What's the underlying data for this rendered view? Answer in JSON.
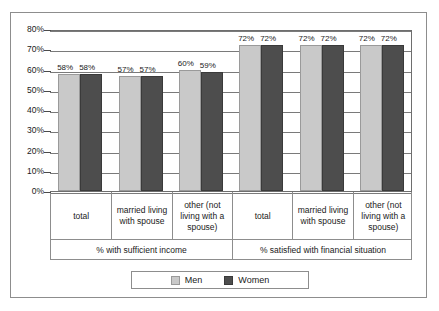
{
  "chart_data": {
    "type": "bar",
    "title": "",
    "xlabel": "",
    "ylabel": "",
    "ylim": [
      0,
      80
    ],
    "ytick_labels": [
      "80%",
      "70%",
      "60%",
      "50%",
      "40%",
      "30%",
      "20%",
      "10%",
      "0%"
    ],
    "ytick_values": [
      80,
      70,
      60,
      50,
      40,
      30,
      20,
      10,
      0
    ],
    "grid": true,
    "legend_position": "bottom",
    "value_suffix": "%",
    "categories": [
      "total",
      "married living with spouse",
      "other (not living with a spouse)",
      "total",
      "married living with spouse",
      "other (not living with a spouse)"
    ],
    "groups": [
      {
        "header": "% with sufficient income",
        "categories": [
          {
            "label": "total",
            "men": 58,
            "women": 58,
            "men_label": "58%",
            "women_label": "58%"
          },
          {
            "label": "married living with spouse",
            "men": 57,
            "women": 57,
            "men_label": "57%",
            "women_label": "57%"
          },
          {
            "label": "other (not living with a spouse)",
            "men": 60,
            "women": 59,
            "men_label": "60%",
            "women_label": "59%"
          }
        ]
      },
      {
        "header": "% satisfied with financial situation",
        "categories": [
          {
            "label": "total",
            "men": 72,
            "women": 72,
            "men_label": "72%",
            "women_label": "72%"
          },
          {
            "label": "married living with spouse",
            "men": 72,
            "women": 72,
            "men_label": "72%",
            "women_label": "72%"
          },
          {
            "label": "other (not living with a spouse)",
            "men": 72,
            "women": 72,
            "men_label": "72%",
            "women_label": "72%"
          }
        ]
      }
    ],
    "series": [
      {
        "name": "Men",
        "color": "#c9c9c9",
        "values": [
          58,
          57,
          60,
          72,
          72,
          72
        ]
      },
      {
        "name": "Women",
        "color": "#4d4d4d",
        "values": [
          58,
          57,
          59,
          72,
          72,
          72
        ]
      }
    ],
    "legend": [
      {
        "name": "Men",
        "color": "#c9c9c9"
      },
      {
        "name": "Women",
        "color": "#4d4d4d"
      }
    ]
  }
}
